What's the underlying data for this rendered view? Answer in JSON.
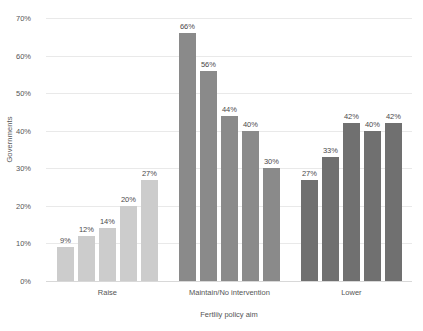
{
  "chart_data": {
    "type": "bar",
    "title": "",
    "xlabel": "Fertliiy policy aim",
    "ylabel": "Governments",
    "ylim": [
      0,
      70
    ],
    "ytick_labels": [
      "0%",
      "10%",
      "20%",
      "30%",
      "40%",
      "50%",
      "60%",
      "70%"
    ],
    "ytick_values": [
      0,
      10,
      20,
      30,
      40,
      50,
      60,
      70
    ],
    "grid": true,
    "legend": "none",
    "categories": [
      "Raise",
      "Maintain/No intervention",
      "Lower"
    ],
    "groups": [
      {
        "category": "Raise",
        "color": "#cccccc",
        "values": [
          9,
          12,
          14,
          20,
          27
        ],
        "labels": [
          "9%",
          "12%",
          "14%",
          "20%",
          "27%"
        ]
      },
      {
        "category": "Maintain/No intervention",
        "color": "#8a8a8a",
        "values": [
          66,
          56,
          44,
          40,
          30
        ],
        "labels": [
          "66%",
          "56%",
          "44%",
          "40%",
          "30%"
        ]
      },
      {
        "category": "Lower",
        "color": "#707070",
        "values": [
          27,
          33,
          42,
          40,
          42
        ],
        "labels": [
          "27%",
          "33%",
          "42%",
          "40%",
          "42%"
        ]
      }
    ]
  },
  "colors": {
    "background": "#ffffff",
    "gridline": "#e9e9e9",
    "baseline": "#d8d8d8",
    "text": "#555555",
    "value_text": "#4a4a4a"
  }
}
